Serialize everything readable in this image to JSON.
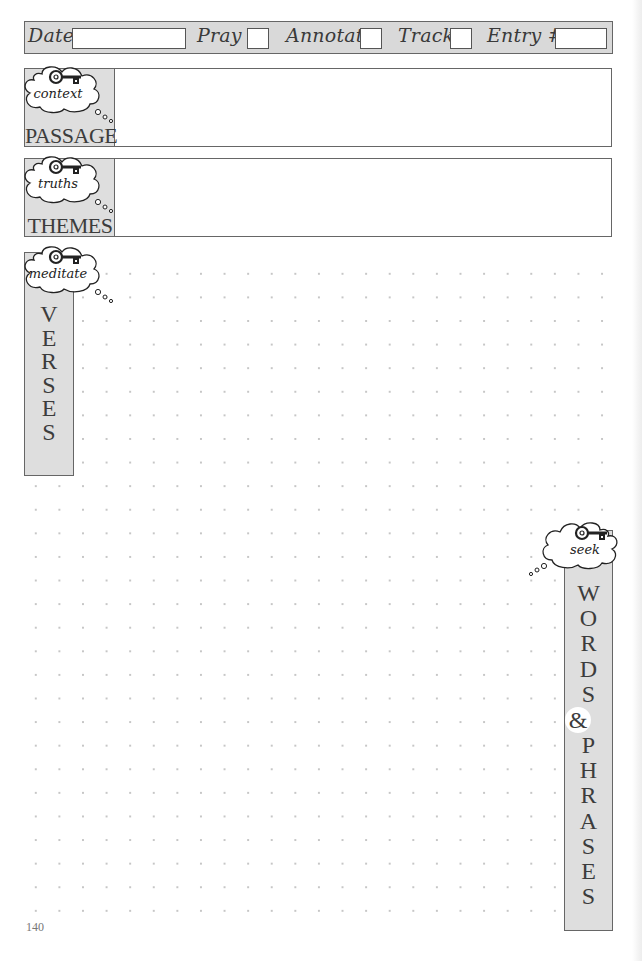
{
  "header": {
    "fields": [
      {
        "label": "Date",
        "value": ""
      },
      {
        "label": "Pray",
        "value": ""
      },
      {
        "label": "Annotate",
        "value": ""
      },
      {
        "label": "Track",
        "value": ""
      },
      {
        "label": "Entry #",
        "value": ""
      }
    ]
  },
  "sections": {
    "passage": {
      "cloud_word": "context",
      "title": "PASSAGE",
      "content": ""
    },
    "themes": {
      "cloud_word": "truths",
      "title": "THEMES",
      "content": ""
    },
    "verses": {
      "cloud_word": "meditate",
      "letters": [
        "V",
        "E",
        "R",
        "S",
        "E",
        "S"
      ]
    },
    "words_phrases": {
      "cloud_word": "seek",
      "letters": [
        "W",
        "O",
        "R",
        "D",
        "S",
        "&",
        "P",
        "H",
        "R",
        "A",
        "S",
        "E",
        "S"
      ]
    }
  },
  "icons": {
    "key": "key-icon",
    "cloud": "thought-cloud-icon"
  },
  "colors": {
    "panel_fill": "#dedede",
    "border": "#666666",
    "dot": "#c6c6c6"
  },
  "page_number": "140"
}
